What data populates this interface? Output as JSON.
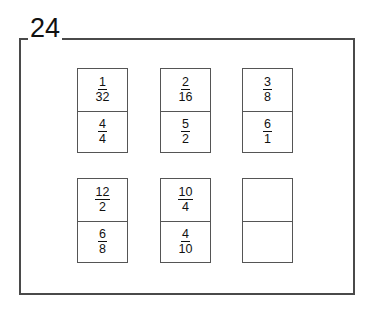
{
  "exercise": {
    "number": "24"
  },
  "colors": {
    "frame_border": "#4a4a4a",
    "card_border": "#555555",
    "text": "#111111",
    "background": "#ffffff"
  },
  "cards": [
    {
      "id": "card-1",
      "top": {
        "numerator": "1",
        "denominator": "32"
      },
      "bottom": {
        "numerator": "4",
        "denominator": "4"
      }
    },
    {
      "id": "card-2",
      "top": {
        "numerator": "2",
        "denominator": "16"
      },
      "bottom": {
        "numerator": "5",
        "denominator": "2"
      }
    },
    {
      "id": "card-3",
      "top": {
        "numerator": "3",
        "denominator": "8"
      },
      "bottom": {
        "numerator": "6",
        "denominator": "1"
      }
    },
    {
      "id": "card-4",
      "top": {
        "numerator": "12",
        "denominator": "2"
      },
      "bottom": {
        "numerator": "6",
        "denominator": "8"
      }
    },
    {
      "id": "card-5",
      "top": {
        "numerator": "10",
        "denominator": "4"
      },
      "bottom": {
        "numerator": "4",
        "denominator": "10"
      }
    },
    {
      "id": "card-6",
      "top": {
        "numerator": "",
        "denominator": ""
      },
      "bottom": {
        "numerator": "",
        "denominator": ""
      }
    }
  ]
}
